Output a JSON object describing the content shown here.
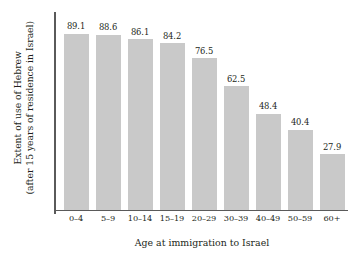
{
  "chart_data": {
    "type": "bar",
    "title": "",
    "subtitle": "",
    "categories": [
      "0–4",
      "5–9",
      "10–14",
      "15–19",
      "20–29",
      "30–39",
      "40–49",
      "50–59",
      "60+"
    ],
    "values": [
      89.1,
      88.6,
      86.1,
      84.2,
      76.5,
      62.5,
      48.4,
      40.4,
      27.9
    ],
    "value_labels": [
      "89.1",
      "88.6",
      "86.1",
      "84.2",
      "76.5",
      "62.5",
      "48.4",
      "40.4",
      "27.9"
    ],
    "xlabel": "Age at immigration to Israel",
    "ylabel": "Extent of use of Hebrew",
    "ylabel_line2": "(after 15 years of residence in Israel)",
    "ylim": [
      0,
      100
    ],
    "grid": false,
    "legend": false,
    "legend_position": "none",
    "tick_labels_y": [],
    "bar_color": "#c9c9c9",
    "axis_color": "#5a5a5a",
    "text_color": "#231f20",
    "background": "#ffffff"
  }
}
